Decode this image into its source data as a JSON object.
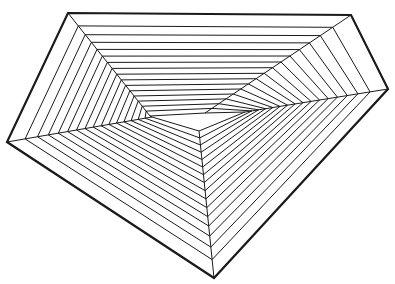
{
  "figure": {
    "outer_pentagon": [
      [
        68,
        13
      ],
      [
        351,
        15
      ],
      [
        388,
        89
      ],
      [
        214,
        278
      ],
      [
        7,
        142
      ]
    ],
    "inner_pentagon": [
      [
        150,
        116
      ],
      [
        205,
        113
      ],
      [
        245,
        112
      ],
      [
        199,
        131
      ],
      [
        152,
        117
      ]
    ],
    "layers": 16,
    "outer_stroke_width": 2.2,
    "inner_stroke_width": 1,
    "stroke_color": "#1a1a1a",
    "background": "#ffffff"
  }
}
